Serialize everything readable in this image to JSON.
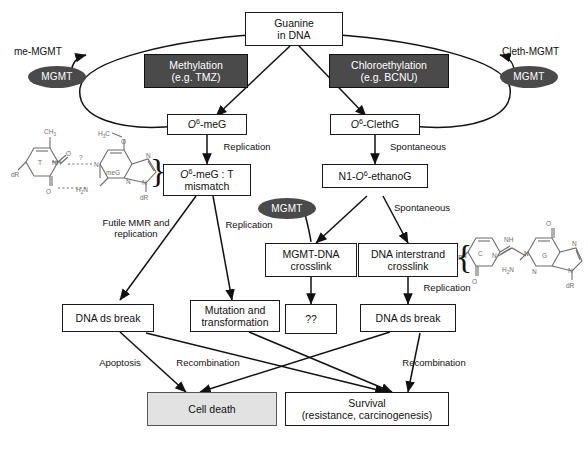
{
  "diagram": {
    "colors": {
      "dark_box": "#4a4a4a",
      "light_box": "#e2e2e2",
      "white_box": "#ffffff",
      "stroke": "#1a1a1a",
      "text_on_dark": "#ffffff"
    },
    "nodes": {
      "guanine": {
        "line1": "Guanine",
        "line2": "in DNA"
      },
      "methylation": {
        "line1": "Methylation",
        "line2": "(e.g. TMZ)"
      },
      "chloroethylation": {
        "line1": "Chloroethylation",
        "line2": "(e.g. BCNU)"
      },
      "o6meg": {
        "prefix": "O",
        "sup": "6",
        "suffix": "-meG"
      },
      "o6clethg": {
        "prefix": "O",
        "sup": "6",
        "suffix": "-ClethG"
      },
      "mismatch": {
        "prefix": "O",
        "sup": "6",
        "mid": "-meG : T",
        "line2": "mismatch"
      },
      "ethanog": {
        "pre": "N1-",
        "prefix": "O",
        "sup": "6",
        "suffix": "-ethanoG"
      },
      "mgmt_dna_crosslink": {
        "line1": "MGMT-DNA",
        "line2": "crosslink"
      },
      "interstrand_crosslink": {
        "line1": "DNA interstrand",
        "line2": "crosslink"
      },
      "unknown": {
        "label": "??"
      },
      "dsbreak_left": {
        "label": "DNA ds break"
      },
      "dsbreak_right": {
        "label": "DNA ds break"
      },
      "mutation": {
        "line1": "Mutation and",
        "line2": "transformation"
      },
      "cell_death": {
        "label": "Cell death"
      },
      "survival": {
        "line1": "Survival",
        "line2": "(resistance, carcinogenesis)"
      }
    },
    "enzymes": {
      "mgmt_left": {
        "label": "MGMT"
      },
      "mgmt_right": {
        "label": "MGMT"
      },
      "mgmt_middle": {
        "label": "MGMT"
      },
      "me_mgmt": {
        "label": "me-MGMT"
      },
      "cleth_mgmt": {
        "label": "Cleth-MGMT"
      }
    },
    "edge_labels": {
      "replication_left": "Replication",
      "spontaneous_right": "Spontaneous",
      "futile_mmr": {
        "line1": "Futile MMR and",
        "line2": "replication"
      },
      "replication_mid": "Replication",
      "spontaneous_mid": "Spontaneous",
      "replication_right": "Replication",
      "apoptosis": "Apoptosis",
      "recombination_left": "Recombination",
      "recombination_right": "Recombination"
    },
    "chem_left": {
      "caption": "O6-meG : T base pair",
      "atoms": [
        "CH",
        "3",
        "O",
        "T",
        "NH",
        "dR",
        "?",
        "H",
        "2",
        "N",
        "N",
        "H",
        "3",
        "C",
        "O",
        "meG",
        "N",
        "N",
        "N",
        "dR"
      ],
      "labels": {
        "methyl": "CH",
        "methyl_sub": "3",
        "oxygen": "O",
        "thymine": "T",
        "nh": "NH",
        "deoxyribose": "dR",
        "query": "?",
        "amine_h": "H",
        "amine_sub": "2",
        "amine_n": "N",
        "meg": "meG",
        "methoxy_h3c": "H",
        "methoxy_sub": "3",
        "methoxy_c": "C",
        "nitrogen": "N"
      }
    },
    "chem_right": {
      "caption": "N1-O6-ethano interstrand crosslink C-G",
      "labels": {
        "nh": "NH",
        "cytosine": "C",
        "guanine": "G",
        "oxygen": "O",
        "nitrogen": "N",
        "amine_h": "H",
        "amine_sub": "2",
        "amine_n": "N",
        "deoxyribose": "dR"
      }
    }
  }
}
